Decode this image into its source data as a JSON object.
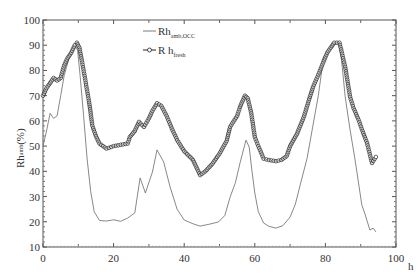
{
  "chart_data": {
    "type": "line",
    "title": "",
    "xlabel": "h",
    "ylabel": {
      "main": "Rh",
      "sub": "amb",
      "unit": "(%)"
    },
    "xlim": [
      0,
      100
    ],
    "ylim": [
      10,
      100
    ],
    "x_ticks": [
      0,
      20,
      40,
      60,
      80,
      100
    ],
    "x_tick_labels": [
      "0",
      "20",
      "40",
      "60",
      "80",
      "100"
    ],
    "y_ticks": [
      10,
      20,
      30,
      40,
      50,
      60,
      70,
      80,
      90,
      100
    ],
    "y_tick_labels": [
      "10",
      "20",
      "30",
      "40",
      "50",
      "60",
      "70",
      "80",
      "90",
      "100"
    ],
    "grid": false,
    "legend_position": "top-center",
    "series": [
      {
        "name": "Rh amb,OCC",
        "label_main": "Rh",
        "label_sub": "amb,OCC",
        "marker": "none",
        "color": "#7a7a7a",
        "x": [
          0,
          1,
          2,
          3,
          4,
          5,
          6,
          7,
          8,
          9,
          9.8,
          10.5,
          11.5,
          12.5,
          13.5,
          14.5,
          16,
          18,
          20,
          22,
          24,
          26,
          27.5,
          29,
          31,
          32.3,
          34.2,
          36,
          38,
          40,
          42.5,
          44.5,
          47,
          49.7,
          51.5,
          53,
          54.5,
          55.8,
          57.5,
          58.4,
          59.2,
          60,
          61,
          62.5,
          64,
          66,
          68,
          70,
          71.5,
          73,
          74.8,
          76.4,
          78,
          79.5,
          81,
          82.5,
          83.7,
          84.6,
          85.6,
          87,
          88.4,
          90.3,
          91.3,
          92.6,
          93.5,
          94.3
        ],
        "y": [
          50,
          56,
          63,
          61,
          62,
          70,
          78,
          83,
          87,
          90,
          88,
          78,
          62,
          45,
          32,
          24,
          20.5,
          20.3,
          20.8,
          20.2,
          21.5,
          23.5,
          37.4,
          31.4,
          39.7,
          48.5,
          43.7,
          33.8,
          25,
          20.7,
          19.2,
          18.3,
          19,
          19.9,
          22.5,
          29.8,
          35.5,
          43.3,
          52.4,
          49.6,
          40,
          31.4,
          24,
          19.5,
          18.2,
          17.5,
          18.5,
          21.9,
          27,
          35.4,
          45,
          57.6,
          70,
          85.3,
          88,
          90,
          91.3,
          84,
          69.5,
          56.4,
          44.5,
          26.7,
          22.7,
          16.7,
          17.5,
          16
        ]
      },
      {
        "name": "R h fresh",
        "label_main": "R h",
        "label_sub": "fresh",
        "marker": "circle",
        "color": "#222222",
        "x": [
          0,
          1,
          2,
          3,
          4,
          5,
          6,
          7,
          8,
          9,
          9.6,
          10.3,
          11,
          12,
          13,
          14,
          15,
          16,
          18,
          20,
          22,
          24,
          24.6,
          26,
          27.2,
          28.6,
          30,
          31,
          32.3,
          33.5,
          35,
          36.5,
          38,
          40,
          42.5,
          44.5,
          46,
          48,
          50,
          52,
          53,
          55,
          55.8,
          57.2,
          58,
          59,
          60,
          61,
          62.5,
          64,
          66,
          67.5,
          69,
          70,
          72,
          74,
          75.6,
          76.5,
          78.5,
          79.6,
          80.5,
          82.5,
          84,
          85.6,
          87,
          88,
          89.4,
          90.5,
          91.8,
          93.2,
          94.3
        ],
        "y": [
          70,
          73,
          75,
          77,
          76,
          77,
          82,
          85,
          87,
          90,
          91,
          89,
          84,
          76,
          68,
          58,
          54,
          51,
          49,
          50,
          50.5,
          51,
          53.6,
          56,
          59.6,
          57.6,
          61,
          64,
          67,
          66,
          62,
          57,
          52.4,
          48,
          44.5,
          38.5,
          40,
          43,
          47,
          52,
          57.6,
          62,
          65.5,
          70,
          69,
          63,
          53.6,
          50,
          45,
          44.5,
          44,
          44.5,
          46,
          50,
          55,
          62,
          69.5,
          73.4,
          80,
          84,
          87,
          91,
          91,
          81.4,
          69.5,
          65,
          60.4,
          56,
          51.2,
          43.3,
          45.7
        ]
      }
    ]
  }
}
